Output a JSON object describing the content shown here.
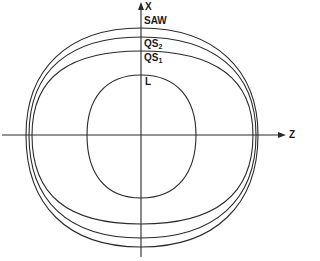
{
  "diagram": {
    "type": "slowness curves / wave surfaces cross-section",
    "axes": {
      "vertical": {
        "label": "X"
      },
      "horizontal": {
        "label": "Z"
      }
    },
    "curves": [
      {
        "id": "SAW",
        "label": "SAW",
        "sub": ""
      },
      {
        "id": "QS2",
        "label": "QS",
        "sub": "2"
      },
      {
        "id": "QS1",
        "label": "QS",
        "sub": "1"
      },
      {
        "id": "L",
        "label": "L",
        "sub": ""
      }
    ],
    "stroke_color": "#2a2a2a"
  }
}
